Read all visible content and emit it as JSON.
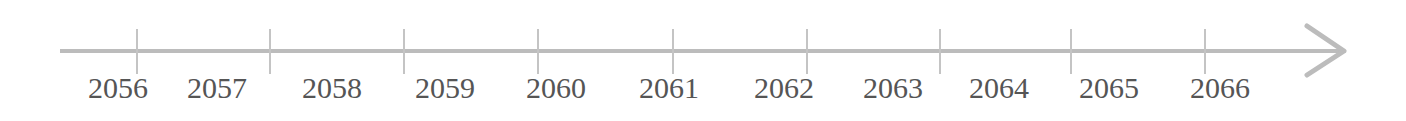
{
  "timeline": {
    "axis_color": "#bcbcbc",
    "text_color": "#555555",
    "labels": [
      {
        "text": "2056",
        "x": 88
      },
      {
        "text": "2057",
        "x": 187
      },
      {
        "text": "2058",
        "x": 302
      },
      {
        "text": "2059",
        "x": 415
      },
      {
        "text": "2060",
        "x": 526
      },
      {
        "text": "2061",
        "x": 639
      },
      {
        "text": "2062",
        "x": 754
      },
      {
        "text": "2063",
        "x": 863
      },
      {
        "text": "2064",
        "x": 969
      },
      {
        "text": "2065",
        "x": 1079
      },
      {
        "text": "2066",
        "x": 1190
      }
    ],
    "ticks": [
      137,
      270,
      404,
      538,
      673,
      807,
      940,
      1071,
      1205
    ],
    "direction_icon": "arrow-right-icon"
  }
}
